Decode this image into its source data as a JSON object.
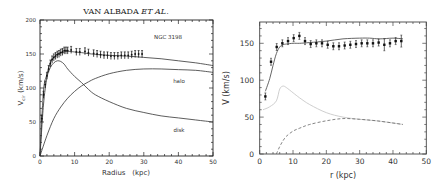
{
  "chart_data": [
    {
      "type": "line",
      "title": "VAN ALBADA ET AL.",
      "annotation": "NGC 3198",
      "xlabel": "Radius (kpc)",
      "ylabel": "V_cir (km/s)",
      "xlim": [
        0,
        50
      ],
      "ylim": [
        0,
        200
      ],
      "xticks": [
        0,
        10,
        20,
        30,
        40,
        50
      ],
      "yticks": [
        0,
        50,
        100,
        150,
        200
      ],
      "grid": false,
      "legend": "inline labels",
      "observed": {
        "x": [
          0.5,
          1.0,
          1.5,
          2.0,
          2.5,
          3.0,
          3.5,
          4.0,
          4.5,
          5.0,
          5.5,
          6.0,
          6.5,
          7.0,
          7.5,
          8.0,
          9.0,
          10.5,
          11.5,
          13.0,
          14.0,
          15.5,
          16.5,
          17.5,
          18.5,
          19.5,
          20.5,
          21.5,
          22.5,
          23.5,
          24.5,
          25.5,
          26.5,
          27.5,
          28.5,
          29.5
        ],
        "y": [
          55,
          90,
          105,
          118,
          128,
          136,
          142,
          145,
          147,
          149,
          150,
          152,
          153,
          155,
          155,
          155,
          156,
          153,
          153,
          154,
          152,
          151,
          150,
          149,
          148,
          148,
          147,
          147,
          147,
          148,
          148,
          148,
          149,
          150,
          150,
          150
        ]
      },
      "series": [
        {
          "name": "total fit",
          "x": [
            0,
            1,
            2,
            3,
            4,
            5,
            6,
            7,
            8,
            10,
            12,
            15,
            20,
            25,
            30,
            35,
            40,
            45,
            50
          ],
          "y": [
            0,
            95,
            120,
            137,
            145,
            150,
            152,
            153,
            154,
            153,
            152,
            150,
            148,
            147,
            145,
            143,
            140,
            137,
            133
          ]
        },
        {
          "name": "disk",
          "x": [
            0,
            1,
            2,
            3,
            4,
            5,
            6,
            7,
            8,
            10,
            12,
            14,
            16,
            20,
            25,
            30,
            35,
            40,
            45,
            50
          ],
          "y": [
            0,
            75,
            115,
            130,
            137,
            140,
            139,
            135,
            128,
            117,
            108,
            98,
            90,
            80,
            70,
            64,
            59,
            56,
            53,
            50
          ]
        },
        {
          "name": "halo",
          "x": [
            0,
            2,
            4,
            6,
            8,
            10,
            12,
            14,
            16,
            20,
            25,
            30,
            35,
            40,
            45,
            50
          ],
          "y": [
            0,
            30,
            55,
            72,
            85,
            95,
            103,
            109,
            114,
            121,
            126,
            128,
            128,
            127,
            126,
            123
          ]
        }
      ],
      "labels": {
        "halo": "halo",
        "disk": "disk"
      }
    },
    {
      "type": "line",
      "title": "",
      "xlabel": "r (kpc)",
      "ylabel": "V (km/s)",
      "xlim": [
        0,
        50
      ],
      "ylim": [
        0,
        180
      ],
      "xticks": [
        0,
        10,
        20,
        30,
        40,
        50
      ],
      "yticks": [
        0,
        50,
        100,
        150
      ],
      "grid": false,
      "observed": {
        "x": [
          1.7,
          3.4,
          5.1,
          6.8,
          8.5,
          10.2,
          11.9,
          13.6,
          15.3,
          17.0,
          18.7,
          20.4,
          22.1,
          23.8,
          25.5,
          27.2,
          28.9,
          30.6,
          32.3,
          34.0,
          35.7,
          37.4,
          39.1,
          40.8,
          42.5
        ],
        "y": [
          78,
          125,
          145,
          150,
          153,
          157,
          160,
          153,
          149,
          150,
          150,
          148,
          146,
          146,
          147,
          148,
          149,
          150,
          150,
          150,
          151,
          148,
          150,
          153,
          153
        ]
      },
      "series": [
        {
          "name": "total fit",
          "style": "solid dark",
          "x": [
            1.7,
            3,
            4,
            5,
            6,
            7,
            8,
            10,
            12,
            15,
            20,
            25,
            30,
            33,
            36,
            40,
            43
          ],
          "y": [
            85,
            102,
            120,
            136,
            145,
            148,
            149,
            150,
            150,
            151,
            153,
            156,
            157,
            157,
            156,
            157,
            156
          ]
        },
        {
          "name": "stellar/gas",
          "style": "solid light gray",
          "x": [
            1,
            3,
            5,
            6,
            7,
            8,
            10,
            12,
            15,
            20,
            25,
            30,
            35,
            40,
            43
          ],
          "y": [
            60,
            64,
            72,
            88,
            92,
            90,
            83,
            76,
            67,
            56,
            50,
            47,
            45,
            42,
            40
          ]
        },
        {
          "name": "dark component",
          "style": "dashed",
          "x": [
            5,
            6,
            7,
            8,
            10,
            12,
            15,
            20,
            25,
            30,
            35,
            40,
            43
          ],
          "y": [
            0,
            10,
            18,
            24,
            31,
            35,
            40,
            45,
            48,
            47,
            45,
            42,
            40
          ]
        }
      ]
    }
  ],
  "left": {
    "title": "VAN ALBADA",
    "title_italic": "ET AL.",
    "annotation": "NGC 3198",
    "halo_label": "halo",
    "disk_label": "disk",
    "xlabel": "Radius   (kpc)",
    "ylabel_main": "V",
    "ylabel_sub": "cir",
    "ylabel_rest": " (km/s)",
    "xtick_labels": [
      "0",
      "10",
      "20",
      "30",
      "40",
      "50"
    ],
    "ytick_labels": [
      "0",
      "50",
      "100",
      "150",
      "200"
    ]
  },
  "right": {
    "xlabel": "r (kpc)",
    "ylabel": "V (km/s)",
    "xtick_labels": [
      "0",
      "10",
      "20",
      "30",
      "40",
      "50"
    ],
    "ytick_labels": [
      "0",
      "50",
      "100",
      "150"
    ]
  }
}
